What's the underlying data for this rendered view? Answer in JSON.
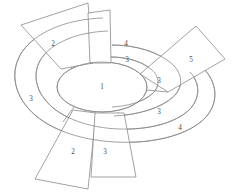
{
  "diagram": {
    "type": "radial-ring-diagram",
    "colors": {
      "background": "#ffffff",
      "stroke": "#8a8a8a",
      "label": "#4a4a4a"
    },
    "core": {
      "name": "center-ellipse",
      "label": "1"
    },
    "rings": [
      {
        "name": "middle-ring",
        "labels": [
          {
            "id": "middle-ring-label-top",
            "text": "3"
          },
          {
            "id": "middle-ring-label-right",
            "text": "3"
          },
          {
            "id": "middle-ring-label-lower",
            "text": "3"
          }
        ]
      },
      {
        "name": "outer-ring",
        "labels": [
          {
            "id": "outer-ring-label-top",
            "text": "4"
          },
          {
            "id": "outer-ring-label-left",
            "text": "3"
          },
          {
            "id": "outer-ring-label-lower-right",
            "text": "4"
          }
        ]
      }
    ],
    "petals": [
      {
        "id": "petal-upper-left",
        "label": "2"
      },
      {
        "id": "petal-top-narrow",
        "label": ""
      },
      {
        "id": "petal-right",
        "label": "5"
      },
      {
        "id": "petal-bottom-left",
        "label": "2"
      },
      {
        "id": "petal-bottom-center",
        "label": "3"
      }
    ]
  }
}
